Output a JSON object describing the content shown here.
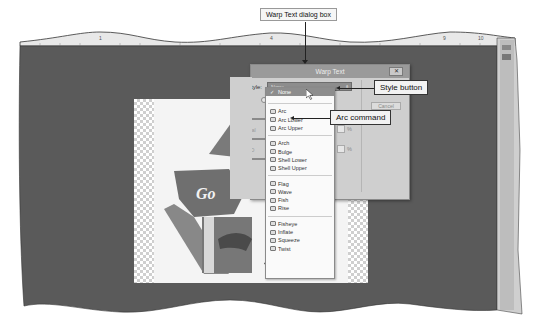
{
  "callouts": {
    "dialog": "Warp Text dialog box",
    "style_button": "Style button",
    "arc_command": "Arc command"
  },
  "ruler": {
    "ticks": [
      "1",
      "4",
      "9",
      "10"
    ]
  },
  "document": {
    "image_text_1": "Go",
    "image_text_2": "G"
  },
  "dialog": {
    "title": "Warp Text",
    "close_label": "✕",
    "style_label": "Style:",
    "style_value": "None",
    "bend_label": "Bend:",
    "horizontal_label": "Horizontal",
    "vertical_label": "Vertical D",
    "percent": "%",
    "side_button": "Cancel"
  },
  "menu": {
    "selected": "None",
    "groups": [
      [
        "Arc",
        "Arc Lower",
        "Arc Upper"
      ],
      [
        "Arch",
        "Bulge",
        "Shell Lower",
        "Shell Upper"
      ],
      [
        "Flag",
        "Wave",
        "Fish",
        "Rise"
      ],
      [
        "Fisheye",
        "Inflate",
        "Squeeze",
        "Twist"
      ]
    ]
  },
  "colors": {
    "workspace": "#5a5a5a",
    "dialog_bg": "#cfcfcf",
    "titlebar": "#9a9a9a",
    "selected": "#8d8d8d"
  }
}
